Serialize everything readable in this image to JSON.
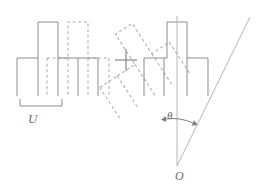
{
  "figure": {
    "domain": "diagram",
    "background_color": "#ffffff",
    "stroke_color_solid": "#8c8c8c",
    "stroke_color_dashed": "#a8a8a8",
    "label_color": "#6b6b6b",
    "caption_color": "#e9e9ec"
  },
  "labels": {
    "period": "U",
    "angle": "θ",
    "origin": "O",
    "operator": "+"
  },
  "caption": {
    "text": ""
  },
  "left_panel": {
    "name": "translated-superposition",
    "description": "Solid comb profile plus a horizontally translated dashed copy",
    "period_bracket": {
      "label": "U",
      "x_start": 20,
      "x_end": 62,
      "y": 104
    },
    "solid_profile": {
      "baseline_y": 58,
      "bump_top_y": 22,
      "x_left": 17,
      "x_right": 98,
      "bump_x_start": 38,
      "bump_x_end": 58,
      "teeth_x": [
        17,
        38,
        58,
        78,
        98
      ],
      "teeth_bottom_y": 96
    },
    "dashed_profile": {
      "offset_x": 40,
      "baseline_y": 58,
      "bump_top_y": 22,
      "bump_x_start": 68,
      "bump_x_end": 88,
      "teeth_x": [
        47,
        68,
        88,
        108
      ],
      "teeth_bottom_y": 96
    }
  },
  "operator_marker": {
    "name": "plus-operator",
    "symbol": "+",
    "center_x": 126,
    "center_y": 60,
    "arm_length": 11
  },
  "right_panel": {
    "name": "rotated-superposition",
    "description": "Solid comb profile plus a copy rotated by theta about point O",
    "rotation": {
      "angle_label": "θ",
      "angle_degrees": 33,
      "pivot_label": "O",
      "pivot_x": 177,
      "pivot_y": 166
    },
    "solid_profile": {
      "baseline_y": 58,
      "bump_top_y": 22,
      "x_left": 144,
      "x_right": 208,
      "bump_x_start": 167,
      "bump_x_end": 187,
      "teeth_x": [
        144,
        164,
        187,
        208
      ],
      "teeth_bottom_y": 96
    },
    "dashed_profile": {
      "rotated": true,
      "about": "O",
      "angle_degrees": 33
    },
    "reference_axis": {
      "from_x": 177,
      "from_y": 16,
      "to_x": 177,
      "to_y": 166
    },
    "rotated_axis": {
      "from_x": 177,
      "from_y": 166,
      "to_x": 249,
      "to_y": 18
    },
    "angle_arc": {
      "cx": 177,
      "cy": 166,
      "radius": 52,
      "start_deg": 270,
      "end_deg": 297
    }
  }
}
